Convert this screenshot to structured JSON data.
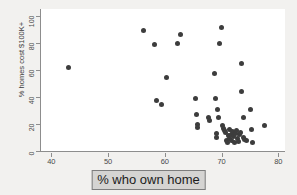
{
  "figure": {
    "background_color": "#f2f1ef",
    "plot_background_color": "#ffffff",
    "axis_color": "#8d8d8d",
    "marker_color": "#3d3d3d"
  },
  "xlabel_box": {
    "text": "% who own home",
    "fill_color": "#d5d4d2",
    "border_color": "#7d7d7d"
  },
  "chart_data": {
    "type": "scatter",
    "title": "",
    "xlabel": "% who own home",
    "ylabel": "% homes cost $100K+",
    "xlim": [
      38,
      81
    ],
    "ylim": [
      0,
      105
    ],
    "xticks": [
      40,
      50,
      60,
      70,
      80
    ],
    "yticks": [
      0,
      20,
      40,
      60,
      80,
      100
    ],
    "xticklabels": [
      "40",
      "50",
      "60",
      "70",
      "80"
    ],
    "yticklabels": [
      "0",
      "20",
      "40",
      "60",
      "80",
      "100"
    ],
    "grid": false,
    "legend": null,
    "marker": "circle",
    "marker_size": 5,
    "series": [
      {
        "name": "states",
        "points": [
          [
            42.8,
            62.0
          ],
          [
            56.1,
            89.0
          ],
          [
            58.0,
            79.0
          ],
          [
            58.3,
            37.0
          ],
          [
            59.2,
            34.5
          ],
          [
            60.2,
            54.0
          ],
          [
            62.0,
            79.5
          ],
          [
            62.6,
            86.5
          ],
          [
            65.3,
            39.0
          ],
          [
            65.4,
            27.0
          ],
          [
            65.5,
            19.5
          ],
          [
            65.5,
            17.5
          ],
          [
            67.6,
            24.5
          ],
          [
            67.7,
            22.5
          ],
          [
            68.6,
            57.5
          ],
          [
            68.7,
            39.0
          ],
          [
            68.9,
            13.0
          ],
          [
            69.0,
            10.0
          ],
          [
            69.1,
            31.0
          ],
          [
            69.2,
            25.0
          ],
          [
            69.4,
            79.5
          ],
          [
            69.8,
            91.0
          ],
          [
            70.0,
            19.0
          ],
          [
            70.2,
            17.0
          ],
          [
            70.4,
            15.0
          ],
          [
            70.6,
            13.5
          ],
          [
            70.7,
            8.0
          ],
          [
            70.9,
            6.0
          ],
          [
            71.0,
            11.5
          ],
          [
            71.2,
            16.0
          ],
          [
            71.3,
            9.0
          ],
          [
            71.5,
            7.5
          ],
          [
            71.6,
            12.5
          ],
          [
            71.8,
            14.5
          ],
          [
            72.0,
            10.5
          ],
          [
            72.1,
            6.5
          ],
          [
            72.3,
            13.0
          ],
          [
            72.5,
            15.5
          ],
          [
            72.6,
            9.5
          ],
          [
            72.8,
            7.0
          ],
          [
            73.0,
            12.0
          ],
          [
            73.2,
            14.0
          ],
          [
            73.3,
            64.5
          ],
          [
            73.4,
            44.0
          ],
          [
            73.6,
            24.5
          ],
          [
            73.7,
            10.0
          ],
          [
            73.9,
            8.5
          ],
          [
            74.2,
            7.5
          ],
          [
            75.0,
            31.0
          ],
          [
            75.1,
            16.0
          ],
          [
            75.3,
            6.5
          ],
          [
            77.4,
            18.5
          ]
        ]
      }
    ]
  }
}
